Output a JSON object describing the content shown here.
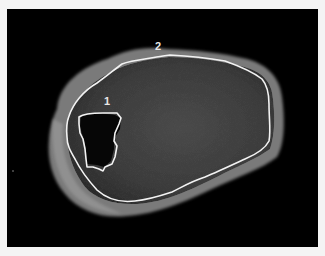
{
  "image": {
    "description": "Grayscale cross-sectional scan with two contour ROIs",
    "background_color": "#000000",
    "page_color": "#f4f4f4",
    "contour_color": "#f2f2f2"
  },
  "regions": [
    {
      "id": 1,
      "label": "1",
      "description": "Small dark inner region outline"
    },
    {
      "id": 2,
      "label": "2",
      "description": "Large outer region outline"
    }
  ],
  "labels": {
    "roi_1": "1",
    "roi_2": "2"
  }
}
